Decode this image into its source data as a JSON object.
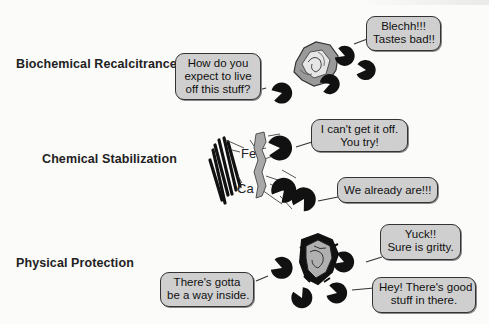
{
  "figure": {
    "rows": [
      {
        "label": "Biochemical Recalcitrance",
        "bubbles": [
          {
            "lines": [
              "How do you",
              "expect to live",
              "off this stuff?"
            ]
          },
          {
            "lines": [
              "Blechh!!!",
              "Tastes bad!!"
            ]
          }
        ]
      },
      {
        "label": "Chemical Stabilization",
        "elements": [
          "Fe",
          "Ca"
        ],
        "bubbles": [
          {
            "lines": [
              "I can't get it off.",
              "You try!"
            ]
          },
          {
            "lines": [
              "We already are!!!"
            ]
          }
        ]
      },
      {
        "label": "Physical Protection",
        "bubbles": [
          {
            "lines": [
              "There's gotta",
              "be a way inside."
            ]
          },
          {
            "lines": [
              "Yuck!!",
              "Sure is gritty."
            ]
          },
          {
            "lines": [
              "Hey! There's good",
              "stuff in there."
            ]
          }
        ]
      }
    ],
    "colors": {
      "bubble_fill": "#cfcfcf",
      "organic_matter": "#9a9a9a",
      "microbe": "#111111"
    }
  }
}
